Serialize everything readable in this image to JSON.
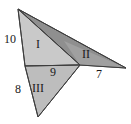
{
  "figure": {
    "kind": "geometry-diagram",
    "background_color": "#ffffff",
    "stroke_color": "#3d3d3d",
    "colors": {
      "region_I_fill": "#c9c9c9",
      "region_II_fill": "#a0a0a0",
      "region_III_fill": "#bdbdbd",
      "upper_wedge_fill": "#8f8f8f",
      "outline": "#3d3d3d",
      "label_text": "#1a1a1a"
    },
    "regions": [
      {
        "id": "I",
        "label": "I",
        "x": 36,
        "y": 38,
        "fill": "#c9c9c9"
      },
      {
        "id": "II",
        "label": "II",
        "x": 82,
        "y": 48,
        "fill": "#a0a0a0"
      },
      {
        "id": "III",
        "label": "III",
        "x": 32,
        "y": 82,
        "fill": "#bdbdbd"
      }
    ],
    "edge_labels": [
      {
        "id": "left-upper",
        "label": "10",
        "x": 4,
        "y": 33
      },
      {
        "id": "left-lower",
        "label": "8",
        "x": 15,
        "y": 83
      },
      {
        "id": "middle",
        "label": "9",
        "x": 50,
        "y": 66
      },
      {
        "id": "right",
        "label": "7",
        "x": 96,
        "y": 68
      }
    ],
    "vertices": {
      "top": {
        "x": 18,
        "y": 9
      },
      "left_mid": {
        "x": 25,
        "y": 66
      },
      "bottom": {
        "x": 38,
        "y": 117
      },
      "notch": {
        "x": 80,
        "y": 65
      },
      "right_tip": {
        "x": 126,
        "y": 68
      }
    },
    "polygons": {
      "region_I": "18,9 25,66 80,65",
      "region_III": "25,66 80,65 38,117",
      "region_II": "80,65 126,68 64,41",
      "upper_wedge": "18,9 80,65 126,68"
    }
  }
}
